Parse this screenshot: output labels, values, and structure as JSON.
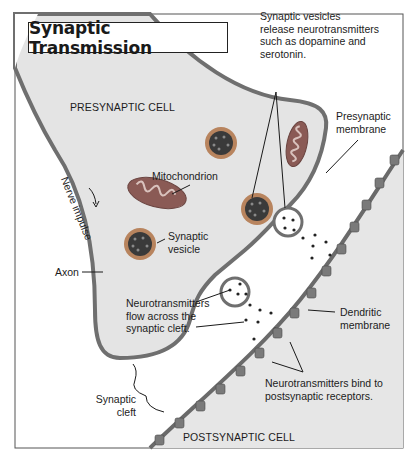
{
  "title": "Synaptic Transmission",
  "colors": {
    "cell_fill": "#e4e4e4",
    "membrane": "#6f6f6f",
    "cleft": "#ffffff",
    "vesicle_outer": "#b8845e",
    "vesicle_inner": "#3a3a3a",
    "mito_fill": "#8a5a55",
    "receptor": "#7a7a7a",
    "border": "#444444"
  },
  "labels": {
    "presynaptic_cell": "PRESYNAPTIC CELL",
    "postsynaptic_cell": "POSTSYNAPTIC CELL",
    "vesicles_release": [
      "Synaptic vesicles",
      "release neurotransmitters",
      "such as dopamine and",
      "serotonin."
    ],
    "presynaptic_membrane": [
      "Presynaptic",
      "membrane"
    ],
    "mitochondrion": "Mitochondrion",
    "nerve_impulse": "Nerve impulse",
    "synaptic_vesicle": [
      "Synaptic",
      "vesicle"
    ],
    "axon": "Axon",
    "nt_flow": [
      "Neurotransmitters",
      "flow across the",
      "synaptic cleft."
    ],
    "dendritic_membrane": [
      "Dendritic",
      "membrane"
    ],
    "nt_bind": [
      "Neurotransmitters bind to",
      "postsynaptic receptors."
    ],
    "synaptic_cleft": [
      "Synaptic",
      "cleft"
    ]
  }
}
